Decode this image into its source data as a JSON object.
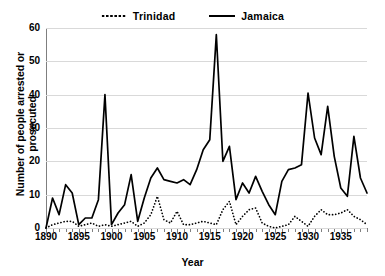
{
  "chart_data": {
    "type": "line",
    "title": "",
    "xlabel": "Year",
    "ylabel": "Number of people arrested or prosecuted",
    "xlim": [
      1890,
      1939
    ],
    "ylim": [
      0,
      60
    ],
    "yticks": [
      0,
      10,
      20,
      30,
      40,
      50,
      60
    ],
    "xticks": [
      1890,
      1895,
      1900,
      1905,
      1910,
      1915,
      1920,
      1925,
      1930,
      1935
    ],
    "grid": "horizontal",
    "legend_position": "top-center",
    "x": [
      1890,
      1891,
      1892,
      1893,
      1894,
      1895,
      1896,
      1897,
      1898,
      1899,
      1900,
      1901,
      1902,
      1903,
      1904,
      1905,
      1906,
      1907,
      1908,
      1909,
      1910,
      1911,
      1912,
      1913,
      1914,
      1915,
      1916,
      1917,
      1918,
      1919,
      1920,
      1921,
      1922,
      1923,
      1924,
      1925,
      1926,
      1927,
      1928,
      1929,
      1930,
      1931,
      1932,
      1933,
      1934,
      1935,
      1936,
      1937,
      1938,
      1939
    ],
    "series": [
      {
        "name": "Jamaica",
        "style": "solid",
        "color": "#000000",
        "values": [
          0,
          9,
          4,
          13,
          10.5,
          1,
          3,
          3,
          8.5,
          40,
          1,
          4.5,
          7,
          16,
          2,
          9,
          15,
          18,
          14.5,
          14,
          13.5,
          14.5,
          13,
          17.5,
          23.5,
          26.5,
          58,
          20,
          24.5,
          8.5,
          13.5,
          10.5,
          15.5,
          11,
          7,
          4,
          14,
          17.5,
          18,
          19,
          40.5,
          27,
          22,
          36.5,
          21.5,
          12,
          9.5,
          27.5,
          15,
          10.5
        ]
      },
      {
        "name": "Trinidad",
        "style": "dotted",
        "color": "#000000",
        "values": [
          0,
          1,
          1.5,
          2,
          2,
          0.5,
          1,
          1.5,
          0.5,
          1,
          0.5,
          1,
          1.5,
          2,
          0.5,
          1.5,
          4,
          9.5,
          2.5,
          1.5,
          5,
          1,
          1,
          1.5,
          2,
          1.5,
          1,
          5.5,
          8,
          1,
          3.5,
          5.5,
          6,
          1.5,
          0.5,
          0,
          0.5,
          1,
          3.5,
          2,
          0.5,
          3.5,
          5.5,
          4,
          4,
          4.5,
          5.5,
          3.5,
          2.5,
          1
        ]
      }
    ]
  },
  "legend": {
    "entries": [
      {
        "label": "Trinidad",
        "marker": "dotted-line-icon"
      },
      {
        "label": "Jamaica",
        "marker": "solid-line-icon"
      }
    ]
  },
  "axes": {
    "y_title": "Number of people arrested or prosecuted",
    "x_title": "Year",
    "y_tick_labels": [
      "0",
      "10",
      "20",
      "30",
      "40",
      "50",
      "60"
    ],
    "x_tick_labels": [
      "1890",
      "1895",
      "1900",
      "1905",
      "1910",
      "1915",
      "1920",
      "1925",
      "1930",
      "1935"
    ]
  },
  "colors": {
    "line": "#000000",
    "grid": "#d9d9d9",
    "axis": "#7f7f7f",
    "background": "#ffffff"
  }
}
